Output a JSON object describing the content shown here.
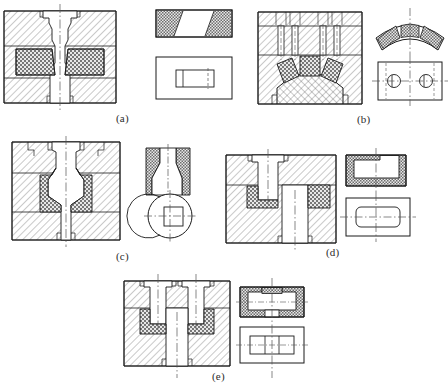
{
  "figure": {
    "kind": "engineering-drawing-plate",
    "background_color": "#ffffff",
    "line_color": "#1a1a1a",
    "hatch_color": "#4a4a4a",
    "insert_fill_color": "#dcdcdc",
    "centerline_color": "#555555",
    "width": 448,
    "height": 391
  },
  "captions": [
    {
      "id": "a",
      "label": "(a)",
      "x": 116,
      "y": 112
    },
    {
      "id": "b",
      "label": "(b)",
      "x": 357,
      "y": 113
    },
    {
      "id": "c",
      "label": "(c)",
      "x": 116,
      "y": 250
    },
    {
      "id": "d",
      "label": "(d)",
      "x": 326,
      "y": 246
    },
    {
      "id": "e",
      "label": "(e)",
      "x": 212,
      "y": 370
    }
  ],
  "groups": [
    {
      "id": "a",
      "name": "group-a",
      "section_view": "symmetric tapered die with two trapezoidal stippled inserts and central funnel cavity",
      "detail_views": [
        {
          "name": "insert-pair-elevation",
          "shape": "rectangle with stippled ends and plain trapezoidal centre"
        },
        {
          "name": "insert-plan",
          "shape": "rectangle containing small inner rectangle"
        }
      ]
    },
    {
      "id": "b",
      "name": "group-b",
      "section_view": "die block with domed punch and three angled stippled arc inserts",
      "detail_views": [
        {
          "name": "arc-segment-elevation",
          "shape": "curved band split into three stippled segments"
        },
        {
          "name": "arc-segment-plan",
          "shape": "rectangle with two circles on horizontal centreline"
        }
      ]
    },
    {
      "id": "c",
      "name": "group-c",
      "section_view": "die block with pair of S-curved stippled inserts forming a V throat",
      "detail_views": [
        {
          "name": "s-insert-elevation",
          "shape": "two S-curved stippled strips"
        },
        {
          "name": "s-insert-plan",
          "shape": "circle with offset arc and inscribed square"
        }
      ]
    },
    {
      "id": "d",
      "name": "group-d",
      "section_view": "stepped offset die with two stippled L-shaped inserts on opposite levels",
      "detail_views": [
        {
          "name": "u-insert-elevation",
          "shape": "stippled U / C shaped ring"
        },
        {
          "name": "u-insert-plan",
          "shape": "rectangle with rounded inner rectangle"
        }
      ]
    },
    {
      "id": "e",
      "name": "group-e",
      "section_view": "twin-bore die with two stippled pocket inserts flanking a central web",
      "detail_views": [
        {
          "name": "pocket-insert-elevation",
          "shape": "stippled open box with small stippled cap"
        },
        {
          "name": "pocket-insert-plan",
          "shape": "rectangle with three-cell inner rectangle"
        }
      ]
    }
  ]
}
